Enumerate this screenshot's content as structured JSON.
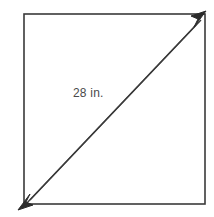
{
  "figure": {
    "background_color": "#ffffff",
    "stroke_color": "#3a3a3a",
    "label_color": "#4a4a4a",
    "shape": {
      "name": "square",
      "left": 24,
      "top": 14,
      "right": 205,
      "bottom": 204,
      "stroke_width": 1.6
    },
    "diagonal": {
      "label": "28 in.",
      "value": 28,
      "unit": "in.",
      "from": "bottom-left",
      "to": "top-right",
      "style": "double-line",
      "arrowheads": "both-ends"
    }
  }
}
